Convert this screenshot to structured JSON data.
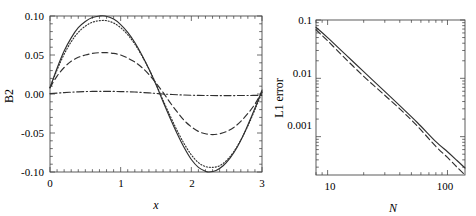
{
  "figure": {
    "background_color": "#ffffff",
    "line_color": "#303030",
    "frame_color": "#4a4a4a",
    "panels": [
      "left",
      "right"
    ]
  },
  "chart_data": [
    {
      "panel": "left",
      "type": "line",
      "title": "",
      "xlabel": "x",
      "ylabel": "B2",
      "xlim": [
        0,
        3
      ],
      "ylim": [
        -0.1,
        0.1
      ],
      "xticks": [
        "0",
        "1",
        "2",
        "3"
      ],
      "xtick_values": [
        0,
        1,
        2,
        3
      ],
      "yticks": [
        "0.10",
        "0.05",
        "0.00",
        "-0.05",
        "-0.10"
      ],
      "ytick_values": [
        0.1,
        0.05,
        0.0,
        -0.05,
        -0.1
      ],
      "xscale": "linear",
      "yscale": "linear",
      "grid": false,
      "legend": "none",
      "minor_ticks": true,
      "series": [
        {
          "name": "solid",
          "style": "solid",
          "x": [
            0.0,
            0.1,
            0.2,
            0.3,
            0.4,
            0.5,
            0.6,
            0.7,
            0.78,
            0.9,
            1.0,
            1.1,
            1.2,
            1.3,
            1.4,
            1.5,
            1.6,
            1.7,
            1.8,
            1.9,
            2.0,
            2.1,
            2.2,
            2.25,
            2.35,
            2.45,
            2.55,
            2.65,
            2.75,
            2.85,
            2.95,
            3.0
          ],
          "y": [
            0.008,
            0.033,
            0.055,
            0.072,
            0.085,
            0.093,
            0.098,
            0.1,
            0.1,
            0.096,
            0.089,
            0.079,
            0.066,
            0.05,
            0.032,
            0.012,
            -0.01,
            -0.031,
            -0.051,
            -0.069,
            -0.084,
            -0.094,
            -0.099,
            -0.1,
            -0.098,
            -0.092,
            -0.082,
            -0.068,
            -0.05,
            -0.029,
            -0.007,
            0.005
          ]
        },
        {
          "name": "dotted",
          "style": "dotted",
          "x": [
            0.0,
            0.1,
            0.2,
            0.3,
            0.4,
            0.5,
            0.6,
            0.7,
            0.8,
            0.9,
            1.0,
            1.1,
            1.2,
            1.3,
            1.4,
            1.5,
            1.6,
            1.7,
            1.8,
            1.9,
            2.0,
            2.1,
            2.2,
            2.3,
            2.4,
            2.5,
            2.6,
            2.7,
            2.8,
            2.9,
            3.0
          ],
          "y": [
            0.008,
            0.031,
            0.051,
            0.067,
            0.079,
            0.087,
            0.092,
            0.094,
            0.094,
            0.091,
            0.085,
            0.076,
            0.064,
            0.049,
            0.032,
            0.013,
            -0.008,
            -0.028,
            -0.047,
            -0.064,
            -0.078,
            -0.088,
            -0.093,
            -0.094,
            -0.092,
            -0.085,
            -0.074,
            -0.059,
            -0.041,
            -0.02,
            0.002
          ]
        },
        {
          "name": "dashed",
          "style": "dashed",
          "x": [
            0.0,
            0.1,
            0.2,
            0.3,
            0.4,
            0.5,
            0.6,
            0.7,
            0.8,
            0.9,
            1.0,
            1.1,
            1.2,
            1.3,
            1.4,
            1.5,
            1.6,
            1.7,
            1.8,
            1.9,
            2.0,
            2.1,
            2.2,
            2.3,
            2.4,
            2.5,
            2.6,
            2.7,
            2.8,
            2.9,
            3.0
          ],
          "y": [
            0.008,
            0.023,
            0.034,
            0.042,
            0.047,
            0.05,
            0.052,
            0.053,
            0.053,
            0.052,
            0.05,
            0.046,
            0.041,
            0.034,
            0.025,
            0.014,
            0.002,
            -0.011,
            -0.023,
            -0.034,
            -0.042,
            -0.048,
            -0.051,
            -0.052,
            -0.051,
            -0.048,
            -0.043,
            -0.035,
            -0.025,
            -0.013,
            0.003
          ]
        },
        {
          "name": "dash-dot",
          "style": "dashdot",
          "x": [
            0.0,
            0.2,
            0.4,
            0.6,
            0.8,
            1.0,
            1.2,
            1.4,
            1.5,
            1.6,
            1.8,
            2.0,
            2.2,
            2.4,
            2.6,
            2.8,
            3.0
          ],
          "y": [
            0.0005,
            0.0018,
            0.0028,
            0.0033,
            0.0034,
            0.0031,
            0.0025,
            0.0014,
            0.0007,
            0.0,
            -0.001,
            -0.0016,
            -0.0019,
            -0.002,
            -0.002,
            -0.0019,
            -0.0017
          ]
        }
      ]
    },
    {
      "panel": "right",
      "type": "line",
      "title": "",
      "xlabel": "N",
      "ylabel": "L1 error",
      "xscale": "log",
      "yscale": "log",
      "xlim": [
        8,
        140
      ],
      "ylim": [
        0.00022,
        0.1
      ],
      "xticks": [
        "10",
        "100"
      ],
      "xtick_values": [
        10,
        100
      ],
      "yticks": [
        "0.1",
        "0.01",
        "0.001"
      ],
      "ytick_values": [
        0.1,
        0.01,
        0.001
      ],
      "grid": false,
      "legend": "none",
      "minor_ticks": true,
      "series": [
        {
          "name": "solid",
          "style": "solid",
          "x": [
            8,
            10,
            14,
            20,
            28,
            40,
            56,
            80,
            100,
            120,
            140
          ],
          "y": [
            0.075,
            0.05,
            0.026,
            0.013,
            0.0068,
            0.0034,
            0.00175,
            0.00082,
            0.00055,
            0.00039,
            0.00029
          ]
        },
        {
          "name": "dashed",
          "style": "dashed",
          "x": [
            8,
            10,
            14,
            20,
            28,
            40,
            56,
            80,
            100,
            120,
            140
          ],
          "y": [
            0.068,
            0.044,
            0.022,
            0.0108,
            0.0058,
            0.003,
            0.00152,
            0.00068,
            0.00044,
            0.0003,
            0.00022
          ]
        }
      ]
    }
  ],
  "left_panel": {
    "ylabel": "B2",
    "xlabel": "x",
    "ytick_labels": [
      "0.10",
      "0.05",
      "0.00",
      "-0.05",
      "-0.10"
    ],
    "xtick_labels": [
      "0",
      "1",
      "2",
      "3"
    ]
  },
  "right_panel": {
    "ylabel": "L1 error",
    "xlabel": "N",
    "ytick_labels": [
      "0.1",
      "0.01",
      "0.001"
    ],
    "xtick_labels": [
      "10",
      "100"
    ]
  }
}
